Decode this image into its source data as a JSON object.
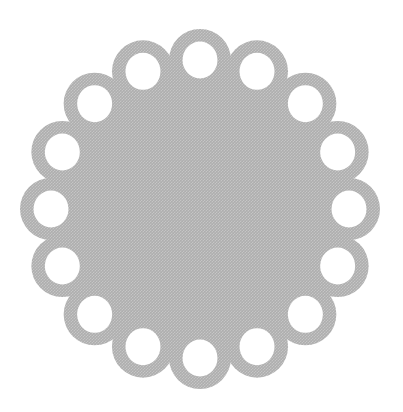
{
  "image": {
    "type": "photograph",
    "subject": "round light-gray woven fabric doily with a scalloped eyelet border",
    "background_color": "#ffffff"
  },
  "doily": {
    "ring_count": 16,
    "fill_color": "#b3b3b3",
    "texture_light_color": "#c7c7c7",
    "texture_dark_color": "#a8a8a8",
    "hole_color": "#ffffff",
    "geometry": {
      "canvas_width": 403,
      "canvas_height": 412,
      "center_x": 200,
      "center_y": 209,
      "disc_radius": 140,
      "ring_center_radius": 149,
      "ring_outer_radius": 31,
      "hole_radius_x": 17.5,
      "hole_radius_y": 18.5,
      "start_angle_deg": -90,
      "step_angle_deg": 22.5,
      "texture_pitch": 3
    }
  }
}
